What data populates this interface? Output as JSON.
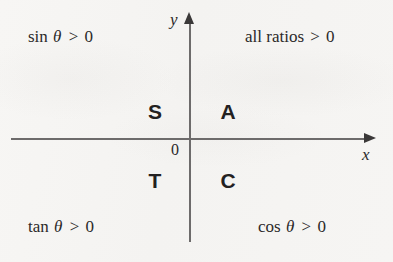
{
  "figure": {
    "background_color": "#f6f5f3",
    "ink_color": "#2b2929",
    "axis_color": "#6d6b6b"
  },
  "axes": {
    "y_label": "y",
    "x_label": "x",
    "origin_label": "0",
    "x_arrow_icon": "arrow-right-icon",
    "y_arrow_icon": "arrow-up-icon"
  },
  "cast_letters": {
    "quadrant_2": "S",
    "quadrant_1": "A",
    "quadrant_3": "T",
    "quadrant_4": "C"
  },
  "quadrant_notes": {
    "quadrant_2": {
      "function": "sin",
      "variable": "θ",
      "relation": ">",
      "value": "0",
      "full_text": "sin θ > 0"
    },
    "quadrant_1": {
      "function": "all ratios",
      "variable": "",
      "relation": ">",
      "value": "0",
      "full_text": "all ratios > 0"
    },
    "quadrant_3": {
      "function": "tan",
      "variable": "θ",
      "relation": ">",
      "value": "0",
      "full_text": "tan θ > 0"
    },
    "quadrant_4": {
      "function": "cos",
      "variable": "θ",
      "relation": ">",
      "value": "0",
      "full_text": "cos θ > 0"
    }
  }
}
